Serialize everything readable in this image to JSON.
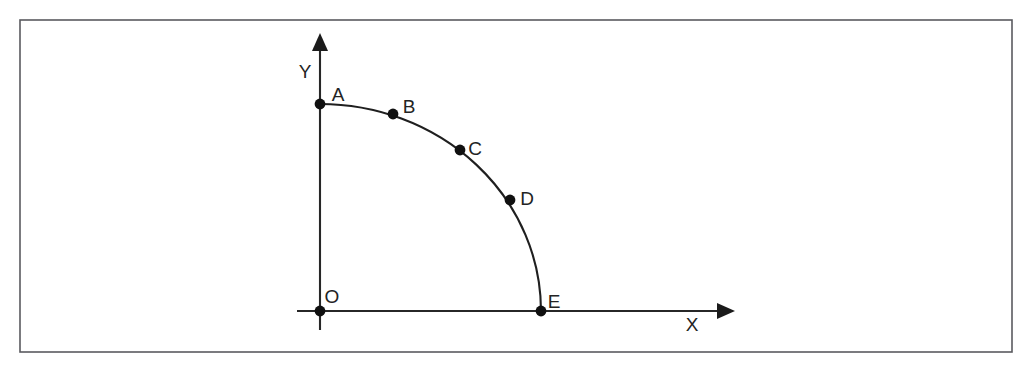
{
  "figure": {
    "width": 1032,
    "height": 369,
    "background_color": "#ffffff",
    "frame": {
      "name": "outer-border",
      "x": 20,
      "y": 20,
      "width": 992,
      "height": 332,
      "stroke_color": "#5a5a5f",
      "stroke_width": 1.6
    }
  },
  "chart_data": {
    "type": "scatter",
    "title": "",
    "xlabel": "X",
    "ylabel": "Y",
    "grid": false,
    "legend": false,
    "origin_label": "O",
    "origin": {
      "x": 320,
      "y": 311
    },
    "axes": {
      "x_axis": {
        "label": "X",
        "label_x": 692,
        "label_y": 326,
        "start_x": 297,
        "end_x": 735,
        "y": 311,
        "arrow": "right",
        "color": "#272727"
      },
      "y_axis": {
        "label": "Y",
        "label_x": 305,
        "label_y": 73,
        "x": 320,
        "start_y": 330,
        "end_y": 34,
        "arrow": "up",
        "color": "#272727"
      }
    },
    "curve": {
      "name": "quarter-ellipse-arc",
      "shape": "quarter-ellipse",
      "stroke_color": "#1f1f1f",
      "stroke_width": 2.1,
      "semi_axis_x": 221,
      "semi_axis_y": 207,
      "start_point": "A",
      "end_point": "E",
      "path": "M 320 104 A 221 207 0 0 1 541 311"
    },
    "labels": [
      "A",
      "B",
      "C",
      "D",
      "E"
    ],
    "points": [
      {
        "label": "A",
        "px": 320,
        "py": 104,
        "x": 0,
        "y": 207,
        "label_px": 338,
        "label_py": 96
      },
      {
        "label": "B",
        "px": 393,
        "py": 114,
        "x": 73,
        "y": 197,
        "label_px": 409,
        "label_py": 108
      },
      {
        "label": "C",
        "px": 460,
        "py": 150,
        "x": 140,
        "y": 161,
        "label_px": 475,
        "label_py": 150
      },
      {
        "label": "D",
        "px": 510,
        "py": 200,
        "x": 190,
        "y": 111,
        "label_px": 527,
        "label_py": 200
      },
      {
        "label": "E",
        "px": 541,
        "py": 311,
        "x": 221,
        "y": 0,
        "label_px": 554,
        "label_py": 303
      }
    ],
    "origin_point": {
      "label": "O",
      "px": 320,
      "py": 311,
      "x": 0,
      "y": 0,
      "label_px": 332,
      "label_py": 298
    },
    "dot_radius": 5.4,
    "dot_color": "#101010",
    "xlim": [
      0,
      260
    ],
    "ylim": [
      0,
      240
    ]
  }
}
